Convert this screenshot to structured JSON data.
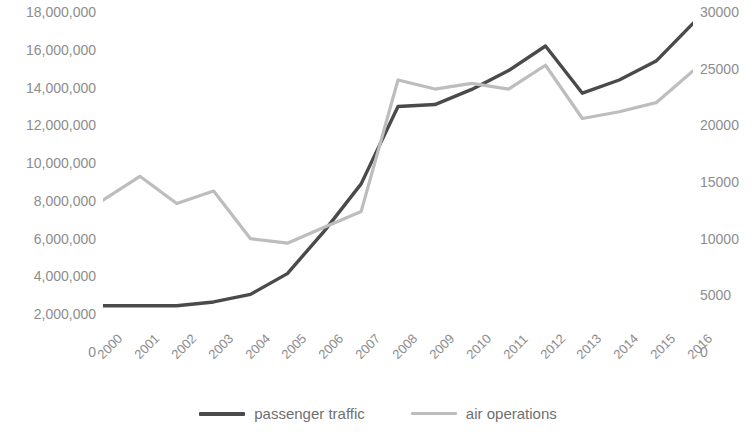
{
  "chart_data": {
    "type": "line",
    "title": "",
    "subtitle": "",
    "xlabel": "",
    "ylabel": "",
    "y2label": "",
    "grid": false,
    "legend_position": "bottom",
    "categories": [
      "2000",
      "2001",
      "2002",
      "2003",
      "2004",
      "2005",
      "2006",
      "2007",
      "2008",
      "2009",
      "2010",
      "2011",
      "2012",
      "2013",
      "2014",
      "2015",
      "2016"
    ],
    "x": [
      2000,
      2001,
      2002,
      2003,
      2004,
      2005,
      2006,
      2007,
      2008,
      2009,
      2010,
      2011,
      2012,
      2013,
      2014,
      2015,
      2016
    ],
    "series": [
      {
        "name": "passenger traffic",
        "axis": "left",
        "color": "#4a4a4a",
        "values": [
          2450000,
          2450000,
          2450000,
          2650000,
          3050000,
          4150000,
          6400000,
          8900000,
          13000000,
          13100000,
          13900000,
          14900000,
          16200000,
          13700000,
          14400000,
          15400000,
          17400000
        ]
      },
      {
        "name": "air operations",
        "axis": "right",
        "color": "#bdbdbd",
        "values": [
          13400,
          15500,
          13100,
          14200,
          10000,
          9600,
          11000,
          12400,
          24000,
          23200,
          23700,
          23200,
          25300,
          20600,
          21200,
          22000,
          24800
        ]
      }
    ],
    "axes": {
      "left": {
        "min": 0,
        "max": 18000000,
        "step": 2000000,
        "ticks": [
          "0",
          "2,000,000",
          "4,000,000",
          "6,000,000",
          "8,000,000",
          "10,000,000",
          "12,000,000",
          "14,000,000",
          "16,000,000",
          "18,000,000"
        ],
        "tick_values": [
          0,
          2000000,
          4000000,
          6000000,
          8000000,
          10000000,
          12000000,
          14000000,
          16000000,
          18000000
        ]
      },
      "right": {
        "min": 0,
        "max": 30000,
        "step": 5000,
        "ticks": [
          "0",
          "5000",
          "10000",
          "15000",
          "20000",
          "25000",
          "30000"
        ],
        "tick_values": [
          0,
          5000,
          10000,
          15000,
          20000,
          25000,
          30000
        ]
      },
      "x": {
        "ticks": [
          "2000",
          "2001",
          "2002",
          "2003",
          "2004",
          "2005",
          "2006",
          "2007",
          "2008",
          "2009",
          "2010",
          "2011",
          "2012",
          "2013",
          "2014",
          "2015",
          "2016"
        ],
        "rotation": -45
      }
    }
  },
  "legend": {
    "items": [
      {
        "label": "passenger traffic",
        "color": "#4a4a4a"
      },
      {
        "label": "air operations",
        "color": "#bdbdbd"
      }
    ]
  },
  "colors": {
    "passenger_traffic": "#4a4a4a",
    "air_operations": "#bdbdbd",
    "axis_text": "#8d8d8d",
    "background": "#ffffff"
  }
}
